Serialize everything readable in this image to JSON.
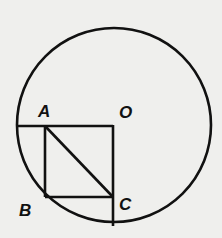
{
  "diagram": {
    "type": "geometry",
    "background": "#efefed",
    "stroke_color": "#111111",
    "circle": {
      "center_label": "O",
      "cx": 114,
      "cy": 125,
      "r": 97
    },
    "points": {
      "A": {
        "label": "A",
        "x": 45,
        "y": 126
      },
      "B": {
        "label": "B",
        "x": 45,
        "y": 197
      },
      "C": {
        "label": "C",
        "x": 113,
        "y": 197
      },
      "O": {
        "label": "O",
        "x": 113,
        "y": 126
      }
    },
    "segments": [
      "horizontal radius through A to O",
      "vertical radius from O through C",
      "AB",
      "BC",
      "AC"
    ]
  }
}
